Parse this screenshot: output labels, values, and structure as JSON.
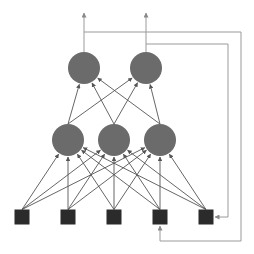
{
  "diagram": {
    "type": "recurrent-neural-network",
    "colors": {
      "background": "#ffffff",
      "neuron": "#6b6b6b",
      "input_unit": "#2b2b2b",
      "edge": "#555555",
      "feedback_edge": "#9a9a9a"
    },
    "layers": {
      "output": [
        {
          "id": "o1",
          "cx": 84,
          "cy": 68,
          "r": 16
        },
        {
          "id": "o2",
          "cx": 146,
          "cy": 68,
          "r": 16
        }
      ],
      "hidden": [
        {
          "id": "h1",
          "cx": 68,
          "cy": 140,
          "r": 16
        },
        {
          "id": "h2",
          "cx": 114,
          "cy": 140,
          "r": 16
        },
        {
          "id": "h3",
          "cx": 160,
          "cy": 140,
          "r": 16
        }
      ],
      "input": [
        {
          "id": "i1",
          "cx": 22,
          "cy": 217,
          "size": 15
        },
        {
          "id": "i2",
          "cx": 68,
          "cy": 217,
          "size": 15
        },
        {
          "id": "i3",
          "cx": 114,
          "cy": 217,
          "size": 15
        },
        {
          "id": "i4",
          "cx": 160,
          "cy": 217,
          "size": 15
        },
        {
          "id": "i5",
          "cx": 206,
          "cy": 217,
          "size": 15,
          "type": "context"
        }
      ]
    },
    "connections": "input-to-hidden fully connected; hidden-to-output fully connected",
    "outputs": [
      {
        "from": "o1",
        "to_y": 13
      },
      {
        "from": "o2",
        "to_y": 13
      }
    ],
    "feedback": [
      {
        "from": "o1",
        "to": "i4",
        "points": [
          [
            84,
            32
          ],
          [
            241,
            32
          ],
          [
            241,
            241
          ],
          [
            160,
            241
          ],
          [
            160,
            226
          ]
        ]
      },
      {
        "from": "o2",
        "to": "i5",
        "points": [
          [
            146,
            44
          ],
          [
            228,
            44
          ],
          [
            228,
            217
          ],
          [
            215,
            217
          ]
        ]
      }
    ]
  }
}
